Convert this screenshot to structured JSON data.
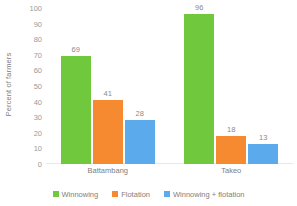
{
  "chart_data": {
    "type": "bar",
    "title": "",
    "xlabel": "",
    "ylabel": "Percent of farmers",
    "categories": [
      "Battambang",
      "Takeo"
    ],
    "series": [
      {
        "name": "Winnowing",
        "color": "#70C83C",
        "values": [
          69,
          96
        ]
      },
      {
        "name": "Flotation",
        "color": "#F58A31",
        "values": [
          41,
          18
        ]
      },
      {
        "name": "Winnowing + flotation",
        "color": "#5BABEC",
        "values": [
          28,
          13
        ]
      }
    ],
    "ylim": [
      0,
      100
    ],
    "yticks": [
      0,
      10,
      20,
      30,
      40,
      50,
      60,
      70,
      80,
      90,
      100
    ],
    "ytick_labels": [
      "0",
      "10",
      "20",
      "30",
      "40",
      "50",
      "60",
      "70",
      "80",
      "90",
      "100"
    ],
    "data_labels": [
      [
        "69",
        "41",
        "28"
      ],
      [
        "96",
        "18",
        "13"
      ]
    ],
    "grid": false,
    "legend_position": "bottom"
  },
  "axis": {
    "y_title": "Percent of farmers"
  }
}
